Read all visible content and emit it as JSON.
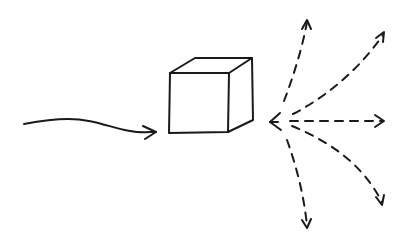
{
  "diagram": {
    "title": "Light scattering off a cube",
    "elements": [
      {
        "id": "incident-ray",
        "type": "solid-wavy-arrow",
        "direction": "right",
        "target": "cube"
      },
      {
        "id": "cube",
        "type": "3d-cube"
      },
      {
        "id": "scatter-origin",
        "type": "arrowhead",
        "direction": "left"
      },
      {
        "id": "scatter-ray-up",
        "type": "dashed-arrow",
        "direction": "up"
      },
      {
        "id": "scatter-ray-up-right",
        "type": "dashed-arrow",
        "direction": "up-right"
      },
      {
        "id": "scatter-ray-right",
        "type": "dashed-arrow",
        "direction": "right"
      },
      {
        "id": "scatter-ray-down-right",
        "type": "dashed-arrow",
        "direction": "down-right"
      },
      {
        "id": "scatter-ray-down",
        "type": "dashed-arrow",
        "direction": "down"
      }
    ],
    "stroke_color": "#1a1a1a",
    "background": "#ffffff"
  }
}
